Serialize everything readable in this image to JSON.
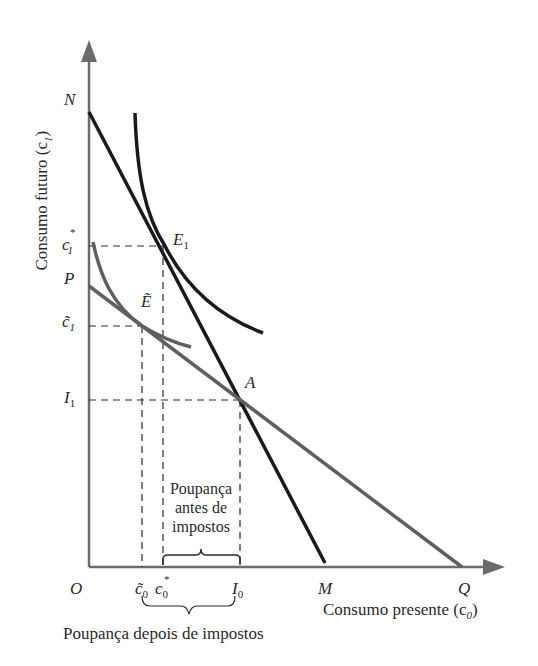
{
  "diagram": {
    "type": "intertemporal consumption / tax effect on savings",
    "axes": {
      "y_label": "Consumo futuro (c",
      "y_label_sub": "1",
      "y_label_close": ")",
      "x_label": "Consumo presente (c",
      "x_label_sub": "0",
      "x_label_close": ")",
      "origin": "O"
    },
    "y_ticks": {
      "N": "N",
      "c1_star": "c",
      "c1_star_sub": "1",
      "c1_star_sup": "*",
      "P": "P",
      "c1_tilde": "c̃",
      "c1_tilde_sub": "1",
      "I1": "I",
      "I1_sub": "1"
    },
    "x_ticks": {
      "c0_tilde": "c̃",
      "c0_tilde_sub": "0",
      "c0_star": "c",
      "c0_star_sub": "0",
      "c0_star_sup": "*",
      "I0": "I",
      "I0_sub": "0",
      "M": "M",
      "Q": "Q"
    },
    "points": {
      "E1": "E",
      "E1_sub": "1",
      "E_tilde": "Ẽ",
      "A": "A"
    },
    "annotations": {
      "savings_before_tax_line1": "Poupança",
      "savings_before_tax_line2": "antes de",
      "savings_before_tax_line3": "impostos",
      "savings_after_tax": "Poupança depois de impostos"
    },
    "colors": {
      "black_line": "#1a1a1a",
      "gray_line": "#5f5f5f",
      "axis": "#6b6b6b",
      "text": "#2a2a2a"
    }
  }
}
